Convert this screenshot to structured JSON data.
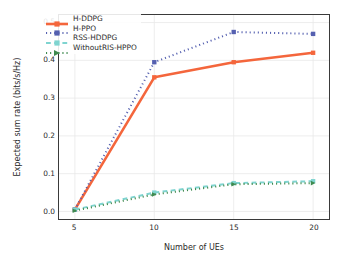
{
  "chart_data": {
    "type": "line",
    "title": "",
    "xlabel": "Number of UEs",
    "ylabel": "Expected sum rate (bits/s/Hz)",
    "x": [
      5,
      10,
      15,
      20
    ],
    "xlim": [
      4,
      21
    ],
    "ylim": [
      -0.02,
      0.52
    ],
    "xticks": [
      "5",
      "10",
      "15",
      "20"
    ],
    "yticks": [
      "0.0",
      "0.1",
      "0.2",
      "0.3",
      "0.4",
      "0.5"
    ],
    "ytick_values": [
      0.0,
      0.1,
      0.2,
      0.3,
      0.4,
      0.5
    ],
    "xtick_values": [
      5,
      10,
      15,
      20
    ],
    "grid": true,
    "legend_position": "upper left",
    "series": [
      {
        "name": "H-DDPG",
        "values": [
          0.005,
          0.355,
          0.395,
          0.42
        ],
        "color": "#f4663c",
        "linestyle": "solid",
        "marker": "square"
      },
      {
        "name": "H-PPO",
        "values": [
          0.005,
          0.395,
          0.475,
          0.47
        ],
        "color": "#5560b0",
        "linestyle": "dotted",
        "marker": "square"
      },
      {
        "name": "RSS-HDDPG",
        "values": [
          0.005,
          0.05,
          0.075,
          0.08
        ],
        "color": "#7fd4d0",
        "linestyle": "dashed",
        "marker": "square"
      },
      {
        "name": "WithoutRIS-HPPO",
        "values": [
          0.002,
          0.045,
          0.072,
          0.075
        ],
        "color": "#3f8a4f",
        "linestyle": "dotted",
        "marker": "triangle"
      }
    ]
  },
  "colors": {
    "axis": "#3a3a3a",
    "grid": "#e8e8e8",
    "background": "#ffffff",
    "text": "#2b2b2b"
  }
}
